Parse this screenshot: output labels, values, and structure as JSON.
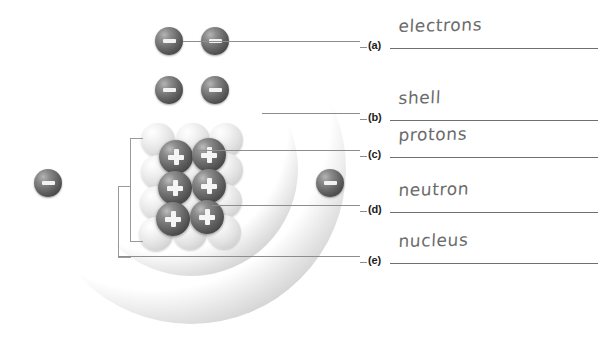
{
  "diagram": {
    "shells": [
      {
        "name": "outer-shell",
        "electron_count": 4
      },
      {
        "name": "inner-shell",
        "electron_count": 2
      }
    ],
    "nucleus": {
      "proton_count": 6,
      "neutron_count": 7,
      "proton_glyph": "plus-sign",
      "neutron_glyph": "blank-sphere",
      "electron_glyph": "minus-sign"
    },
    "colors": {
      "electron": "#5a5a5a",
      "proton": "#565656",
      "neutron": "#e6e6e6",
      "shell_ring": "#d8d8d8",
      "leader_line": "#8d8d8d",
      "answer_line": "#6f6f6f",
      "handwriting": "#6b6b6b",
      "background": "#ffffff"
    },
    "electrons": [
      {
        "name": "electron-outer-top-left",
        "x": 169,
        "y": 41
      },
      {
        "name": "electron-outer-top-right",
        "x": 215,
        "y": 41
      },
      {
        "name": "electron-inner-top-left",
        "x": 169,
        "y": 90
      },
      {
        "name": "electron-inner-top-right",
        "x": 215,
        "y": 90
      },
      {
        "name": "electron-outer-left",
        "x": 48,
        "y": 183
      },
      {
        "name": "electron-outer-right",
        "x": 330,
        "y": 183
      }
    ],
    "protons": [
      {
        "name": "proton-1",
        "x": 176,
        "y": 157
      },
      {
        "name": "proton-2",
        "x": 209,
        "y": 155
      },
      {
        "name": "proton-3",
        "x": 175,
        "y": 188
      },
      {
        "name": "proton-4",
        "x": 209,
        "y": 186
      },
      {
        "name": "proton-5",
        "x": 173,
        "y": 219
      },
      {
        "name": "proton-6",
        "x": 207,
        "y": 217
      }
    ],
    "neutrons": [
      {
        "name": "neutron-1",
        "x": 193,
        "y": 140
      },
      {
        "name": "neutron-2",
        "x": 158,
        "y": 172
      },
      {
        "name": "neutron-3",
        "x": 192,
        "y": 171
      },
      {
        "name": "neutron-4",
        "x": 226,
        "y": 170
      },
      {
        "name": "neutron-5",
        "x": 157,
        "y": 203
      },
      {
        "name": "neutron-6",
        "x": 191,
        "y": 202
      },
      {
        "name": "neutron-7",
        "x": 225,
        "y": 201
      }
    ],
    "leaders": [
      {
        "name": "leader-a",
        "x": 183,
        "y": 41,
        "width": 177
      },
      {
        "name": "leader-b",
        "x": 262,
        "y": 113,
        "width": 98
      },
      {
        "name": "leader-c",
        "x": 196,
        "y": 150,
        "width": 164
      },
      {
        "name": "leader-d",
        "x": 212,
        "y": 205,
        "width": 148
      },
      {
        "name": "leader-e",
        "x": 118,
        "y": 256,
        "width": 242
      }
    ]
  },
  "answers": {
    "rows": [
      {
        "letter": "(a)",
        "value": "electrons",
        "top": 26
      },
      {
        "letter": "(b)",
        "value": "shell",
        "top": 98
      },
      {
        "letter": "(c)",
        "value": "protons",
        "top": 135
      },
      {
        "letter": "(d)",
        "value": "neutron",
        "top": 190
      },
      {
        "letter": "(e)",
        "value": "nucleus",
        "top": 241
      }
    ]
  }
}
